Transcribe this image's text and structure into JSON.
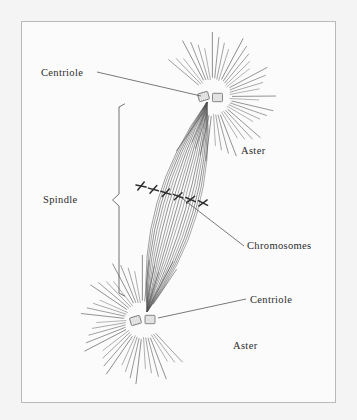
{
  "figure": {
    "frame_color": "#b9b9b9",
    "background_color": "#fbfbfb",
    "page_background_color": "#f2f2f2",
    "ink_color": "#555555",
    "chromosome_color": "#333333",
    "label_color": "#2b2b2b"
  },
  "labels": {
    "centriole_top": "Centriole",
    "aster_top": "Aster",
    "spindle": "Spindle",
    "chromosomes": "Chromosomes",
    "centriole_bottom": "Centriole",
    "aster_bottom": "Aster"
  },
  "structures": {
    "aster_top": {
      "name": "top-aster",
      "center_x": 213,
      "center_y": 97,
      "ray_count": 52,
      "inner_radius": 17,
      "outer_radius": 62
    },
    "aster_bottom": {
      "name": "bottom-aster",
      "center_x": 143,
      "center_y": 320,
      "ray_count": 52,
      "inner_radius": 17,
      "outer_radius": 62
    },
    "spindle": {
      "name": "spindle-fiber-bundle",
      "pole_top_x": 207,
      "pole_top_y": 102,
      "pole_bottom_x": 147,
      "pole_bottom_y": 312,
      "fiber_count": 17
    },
    "chromosomes": {
      "name": "metaphase-chromosomes",
      "count": 6,
      "plate_start_x": 141,
      "plate_start_y": 186,
      "plate_end_x": 203,
      "plate_end_y": 203
    },
    "bracket": {
      "name": "spindle-bracket",
      "x": 119,
      "top_y": 104,
      "bottom_y": 296,
      "notch_y": 200
    }
  },
  "leaders": {
    "centriole_top": {
      "from_x": 97,
      "from_y": 72,
      "to_x": 201,
      "to_y": 96
    },
    "chromosomes": {
      "from_x": 244,
      "from_y": 246,
      "to_x": 183,
      "to_y": 199
    },
    "centriole_bottom": {
      "from_x": 246,
      "from_y": 299,
      "to_x": 158,
      "to_y": 318
    }
  }
}
